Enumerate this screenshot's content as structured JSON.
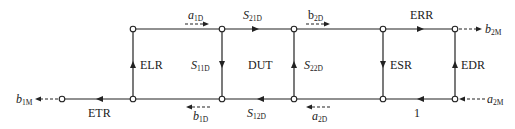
{
  "diagram": {
    "type": "signal-flow-graph",
    "title": "",
    "labels": {
      "a1D": {
        "main": "a",
        "sub": "1D"
      },
      "b1D": {
        "main": "b",
        "sub": "1D"
      },
      "a2D": {
        "main": "a",
        "sub": "2D"
      },
      "b2D": {
        "main": "b",
        "sub": "2D"
      },
      "b1M": {
        "main": "b",
        "sub": "1M"
      },
      "b2M": {
        "main": "b",
        "sub": "2M"
      },
      "a2M": {
        "main": "a",
        "sub": "2M"
      },
      "S21D": {
        "main": "S",
        "sub": "21D"
      },
      "S11D": {
        "main": "S",
        "sub": "11D"
      },
      "S22D": {
        "main": "S",
        "sub": "22D"
      },
      "S12D": {
        "main": "S",
        "sub": "12D"
      },
      "ELR": "ELR",
      "ETR": "ETR",
      "DUT": "DUT",
      "ERR": "ERR",
      "ESR": "ESR",
      "EDR": "EDR",
      "unity": "1"
    },
    "nodes": [
      {
        "id": "b1M_node",
        "x": 62,
        "y": 99
      },
      {
        "id": "n1",
        "x": 133,
        "y": 29
      },
      {
        "id": "n2",
        "x": 222,
        "y": 29
      },
      {
        "id": "n3",
        "x": 294,
        "y": 29
      },
      {
        "id": "n4",
        "x": 383,
        "y": 29
      },
      {
        "id": "n5",
        "x": 455,
        "y": 29
      },
      {
        "id": "n6",
        "x": 133,
        "y": 99
      },
      {
        "id": "n7",
        "x": 222,
        "y": 99
      },
      {
        "id": "n8",
        "x": 294,
        "y": 99
      },
      {
        "id": "n9",
        "x": 383,
        "y": 99
      },
      {
        "id": "n10",
        "x": 455,
        "y": 99
      }
    ],
    "edges": [
      {
        "from": "n1",
        "to": "n2",
        "label": "",
        "direction": "right"
      },
      {
        "from": "n2",
        "to": "n3",
        "label": "S21D",
        "direction": "right"
      },
      {
        "from": "n3",
        "to": "n4",
        "label": "",
        "direction": "right"
      },
      {
        "from": "n4",
        "to": "n5",
        "label": "ERR",
        "direction": "right"
      },
      {
        "from": "n6",
        "to": "n1",
        "label": "ELR",
        "direction": "up"
      },
      {
        "from": "n2",
        "to": "n7",
        "label": "S11D",
        "direction": "down"
      },
      {
        "from": "n8",
        "to": "n3",
        "label": "S22D",
        "direction": "up"
      },
      {
        "from": "n4",
        "to": "n9",
        "label": "ESR",
        "direction": "down"
      },
      {
        "from": "n10",
        "to": "n5",
        "label": "EDR",
        "direction": "up"
      },
      {
        "from": "n10",
        "to": "n9",
        "label": "1",
        "direction": "left"
      },
      {
        "from": "n9",
        "to": "n8",
        "label": "",
        "direction": "left"
      },
      {
        "from": "n8",
        "to": "n7",
        "label": "S12D",
        "direction": "left"
      },
      {
        "from": "n7",
        "to": "n6",
        "label": "",
        "direction": "left"
      },
      {
        "from": "n6",
        "to": "b1M_node",
        "label": "ETR",
        "direction": "left"
      }
    ]
  }
}
